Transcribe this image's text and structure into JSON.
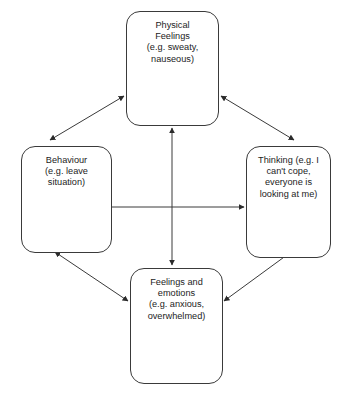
{
  "diagram": {
    "background_color": "#ffffff",
    "line_color": "#3a3a3a",
    "text_color": "#1c1c1c",
    "nodes": [
      {
        "id": "physical",
        "label": "Physical\nFeelings\n(e.g. sweaty,\nnauseous)",
        "position": "top"
      },
      {
        "id": "behaviour",
        "label": "Behaviour\n(e.g. leave\nsituation)",
        "position": "left"
      },
      {
        "id": "thinking",
        "label": "Thinking (e.g. I\ncan't cope,\neveryone is\nlooking at me)",
        "position": "right"
      },
      {
        "id": "feelings",
        "label": "Feelings and\nemotions\n(e.g. anxious,\noverwhelmed)",
        "position": "bottom"
      }
    ],
    "connectors": [
      {
        "id": "physical-behaviour",
        "from": "physical",
        "to": "behaviour",
        "style": "double-headed-arrow"
      },
      {
        "id": "physical-thinking",
        "from": "physical",
        "to": "thinking",
        "style": "double-headed-arrow"
      },
      {
        "id": "behaviour-feelings",
        "from": "behaviour",
        "to": "feelings",
        "style": "double-headed-arrow"
      },
      {
        "id": "thinking-feelings",
        "from": "thinking",
        "to": "feelings",
        "style": "double-headed-arrow"
      },
      {
        "id": "physical-feelings",
        "from": "physical",
        "to": "feelings",
        "style": "double-headed-arrow"
      },
      {
        "id": "behaviour-thinking",
        "from": "behaviour",
        "to": "thinking",
        "style": "double-headed-arrow"
      }
    ]
  }
}
